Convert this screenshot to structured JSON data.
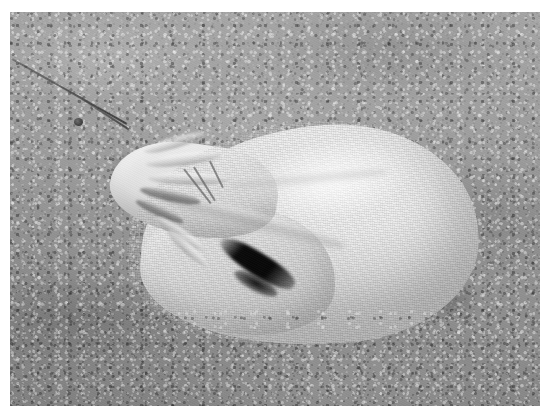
{
  "image": {
    "kind": "photograph",
    "orientation": "landscape",
    "width": 540,
    "height": 406,
    "color_mode": "grayscale",
    "caption": "A white woven drawstring sack lying on coarse gray gravel, cinched shut at its left end with a thin cord trailing off to the upper left.",
    "subject": "drawstring sandbag",
    "scene": "gravel ground, outdoors, overhead daylight"
  },
  "frame": {
    "paper_color": "#ffffff",
    "margin_left": 10,
    "margin_top": 12,
    "margin_right": 0,
    "margin_bottom": 0
  },
  "palette": {
    "paper_white": "#ffffff",
    "ground_light": "#a3a3a3",
    "ground_mid": "#989898",
    "ground_dark": "#8a8a8a",
    "fabric_highlight": "#f2f2f2",
    "fabric_mid": "#dcdcdc",
    "fabric_shade": "#ababab",
    "cinch_shadow": "#090909",
    "cord_dark": "#2e2e2e"
  },
  "regions": [
    {
      "name": "background-ground",
      "label": "Gravel ground",
      "description": "Granular sand and small-stone surface filling the frame; smoother and lighter toward the top, coarser and slightly darker toward the bottom foreground."
    },
    {
      "name": "drawstring-cord",
      "label": "Drawstring cord",
      "description": "Thin dark cord entering at the upper left edge and running diagonally down to the right, passing through a small knot before disappearing into the bag's cinched neck."
    },
    {
      "name": "cinched-neck",
      "label": "Cinched neck",
      "description": "The gathered, pleated mouth of the sack at its left end, tied shut, with a deep near-black shadow wedge beneath the gathers."
    },
    {
      "name": "bag-body",
      "label": "Sack body",
      "description": "Plump teardrop-shaped body of white woven fabric, brightest along its upper-left swell, shading to gray along the lower-right contour."
    },
    {
      "name": "fold-crease",
      "label": "Fold crease",
      "description": "A long diagonal fold running across the lower-left of the sack where the fabric slumps toward the ground."
    },
    {
      "name": "contact-shadow",
      "label": "Contact shadow",
      "description": "Soft dark shadow where the sack's underside meets the gravel, strongest beneath the bottom contour and to the left of the cinch."
    }
  ],
  "texture": {
    "fabric_weave": "fine horizontal woven lines across the sack",
    "ground_grain": "dense granular speckle of light and dark stones"
  }
}
